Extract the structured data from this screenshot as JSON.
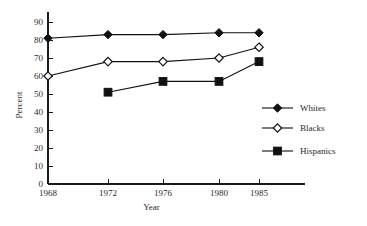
{
  "chart_data": {
    "type": "line",
    "title": "",
    "xlabel": "Year",
    "ylabel": "Percent",
    "x": [
      1968,
      1972,
      1976,
      1980,
      1985
    ],
    "categories": [
      "1968",
      "1972",
      "1976",
      "1980",
      "1985"
    ],
    "ylim": [
      0,
      90
    ],
    "yticks": [
      0,
      10,
      20,
      30,
      40,
      50,
      60,
      70,
      80,
      90
    ],
    "ytick_labels": [
      "0",
      "10",
      "20",
      "30",
      "40",
      "50",
      "60",
      "70",
      "80",
      "90"
    ],
    "xtick_labels": [
      "1968",
      "1972",
      "1976",
      "1980",
      "1985"
    ],
    "grid": false,
    "legend_position": "right",
    "series": [
      {
        "name": "Whites",
        "marker": "filled-diamond",
        "color": "#111111",
        "x": [
          1968,
          1972,
          1976,
          1980,
          1985
        ],
        "values": [
          81,
          83,
          83,
          84,
          84
        ]
      },
      {
        "name": "Blacks",
        "marker": "open-diamond",
        "color": "#111111",
        "x": [
          1968,
          1972,
          1976,
          1980,
          1985
        ],
        "values": [
          60,
          68,
          68,
          70,
          76
        ]
      },
      {
        "name": "Hispanics",
        "marker": "filled-square",
        "color": "#111111",
        "x": [
          1972,
          1976,
          1980,
          1985
        ],
        "values": [
          51,
          57,
          57,
          68
        ]
      }
    ]
  },
  "axis": {
    "y_title": "Percent",
    "x_title": "Year"
  },
  "legend": {
    "entries": [
      {
        "label": "Whites",
        "marker": "filled-diamond"
      },
      {
        "label": "Blacks",
        "marker": "open-diamond"
      },
      {
        "label": "Hispanics",
        "marker": "filled-square"
      }
    ]
  }
}
